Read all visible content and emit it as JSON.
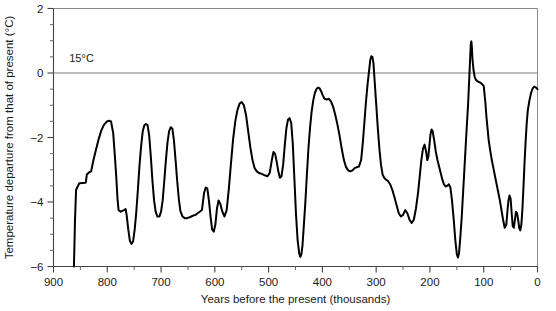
{
  "chart_data": {
    "type": "line",
    "title": "",
    "xlabel": "Years before the present (thousands)",
    "ylabel": "Temperature departure from that of present (°C)",
    "xlim": [
      900,
      0
    ],
    "ylim": [
      -6,
      2
    ],
    "x_ticks": [
      900,
      800,
      700,
      600,
      500,
      400,
      300,
      200,
      100,
      0
    ],
    "x_tick_labels": [
      "900",
      "800",
      "700",
      "600",
      "500",
      "400",
      "300",
      "200",
      "100",
      "0"
    ],
    "x_minor_step": 50,
    "y_ticks": [
      2,
      0,
      -2,
      -4,
      -6
    ],
    "y_tick_labels": [
      "2",
      "0",
      "−2",
      "−4",
      "−6"
    ],
    "y_minor_step": 0.5,
    "x_axis_reversed": true,
    "grid": false,
    "legend": null,
    "annotations": [
      {
        "text": "15°C",
        "x": 880,
        "y": 0.35,
        "note": "label for the present-day mean temperature reference line at 0"
      }
    ],
    "reference_lines": [
      {
        "axis": "y",
        "value": 0,
        "label": "15°C"
      }
    ],
    "series": [
      {
        "name": "Temperature departure",
        "color": "#000000",
        "points": [
          [
            862,
            -6.0
          ],
          [
            860,
            -4.55
          ],
          [
            858,
            -3.62
          ],
          [
            852,
            -3.42
          ],
          [
            840,
            -3.4
          ],
          [
            838,
            -3.15
          ],
          [
            833,
            -3.07
          ],
          [
            830,
            -3.05
          ],
          [
            826,
            -2.72
          ],
          [
            821,
            -2.38
          ],
          [
            816,
            -2.05
          ],
          [
            811,
            -1.78
          ],
          [
            806,
            -1.6
          ],
          [
            801,
            -1.51
          ],
          [
            797,
            -1.48
          ],
          [
            793,
            -1.5
          ],
          [
            789,
            -1.86
          ],
          [
            786,
            -2.55
          ],
          [
            783,
            -3.3
          ],
          [
            781,
            -3.9
          ],
          [
            779,
            -4.25
          ],
          [
            775,
            -4.3
          ],
          [
            769,
            -4.25
          ],
          [
            766,
            -4.22
          ],
          [
            764,
            -4.4
          ],
          [
            761,
            -4.85
          ],
          [
            758,
            -5.2
          ],
          [
            755,
            -5.3
          ],
          [
            752,
            -5.22
          ],
          [
            749,
            -4.85
          ],
          [
            746,
            -4.3
          ],
          [
            743,
            -3.6
          ],
          [
            740,
            -2.85
          ],
          [
            737,
            -2.25
          ],
          [
            734,
            -1.8
          ],
          [
            731,
            -1.62
          ],
          [
            728,
            -1.58
          ],
          [
            725,
            -1.62
          ],
          [
            722,
            -1.95
          ],
          [
            719,
            -2.6
          ],
          [
            716,
            -3.35
          ],
          [
            713,
            -3.95
          ],
          [
            710,
            -4.3
          ],
          [
            707,
            -4.45
          ],
          [
            703,
            -4.45
          ],
          [
            700,
            -4.3
          ],
          [
            697,
            -3.95
          ],
          [
            694,
            -3.35
          ],
          [
            691,
            -2.7
          ],
          [
            688,
            -2.15
          ],
          [
            685,
            -1.8
          ],
          [
            682,
            -1.68
          ],
          [
            679,
            -1.72
          ],
          [
            676,
            -2.1
          ],
          [
            673,
            -2.7
          ],
          [
            670,
            -3.35
          ],
          [
            667,
            -3.9
          ],
          [
            664,
            -4.28
          ],
          [
            660,
            -4.45
          ],
          [
            656,
            -4.5
          ],
          [
            652,
            -4.5
          ],
          [
            648,
            -4.48
          ],
          [
            644,
            -4.45
          ],
          [
            640,
            -4.42
          ],
          [
            636,
            -4.4
          ],
          [
            632,
            -4.35
          ],
          [
            628,
            -4.3
          ],
          [
            624,
            -4.25
          ],
          [
            620,
            -3.72
          ],
          [
            617,
            -3.55
          ],
          [
            614,
            -3.58
          ],
          [
            611,
            -3.95
          ],
          [
            608,
            -4.45
          ],
          [
            605,
            -4.85
          ],
          [
            602,
            -4.92
          ],
          [
            599,
            -4.7
          ],
          [
            596,
            -4.2
          ],
          [
            593,
            -3.95
          ],
          [
            590,
            -4.05
          ],
          [
            586,
            -4.3
          ],
          [
            582,
            -4.45
          ],
          [
            578,
            -4.25
          ],
          [
            574,
            -3.6
          ],
          [
            570,
            -2.8
          ],
          [
            566,
            -2.05
          ],
          [
            562,
            -1.5
          ],
          [
            558,
            -1.15
          ],
          [
            554,
            -0.95
          ],
          [
            550,
            -0.9
          ],
          [
            546,
            -1.0
          ],
          [
            542,
            -1.3
          ],
          [
            538,
            -1.8
          ],
          [
            534,
            -2.3
          ],
          [
            530,
            -2.7
          ],
          [
            526,
            -2.95
          ],
          [
            522,
            -3.05
          ],
          [
            518,
            -3.1
          ],
          [
            514,
            -3.12
          ],
          [
            510,
            -3.15
          ],
          [
            506,
            -3.18
          ],
          [
            502,
            -3.2
          ],
          [
            498,
            -3.1
          ],
          [
            494,
            -2.7
          ],
          [
            491,
            -2.45
          ],
          [
            488,
            -2.5
          ],
          [
            485,
            -2.75
          ],
          [
            482,
            -3.05
          ],
          [
            479,
            -3.25
          ],
          [
            476,
            -3.2
          ],
          [
            473,
            -2.85
          ],
          [
            470,
            -2.25
          ],
          [
            467,
            -1.72
          ],
          [
            464,
            -1.45
          ],
          [
            461,
            -1.4
          ],
          [
            458,
            -1.55
          ],
          [
            455,
            -2.2
          ],
          [
            452,
            -3.3
          ],
          [
            449,
            -4.4
          ],
          [
            446,
            -5.2
          ],
          [
            443,
            -5.6
          ],
          [
            441,
            -5.7
          ],
          [
            439,
            -5.62
          ],
          [
            437,
            -5.35
          ],
          [
            435,
            -4.85
          ],
          [
            432,
            -4.1
          ],
          [
            429,
            -3.2
          ],
          [
            426,
            -2.35
          ],
          [
            423,
            -1.7
          ],
          [
            420,
            -1.2
          ],
          [
            417,
            -0.85
          ],
          [
            414,
            -0.62
          ],
          [
            411,
            -0.5
          ],
          [
            408,
            -0.45
          ],
          [
            405,
            -0.48
          ],
          [
            402,
            -0.58
          ],
          [
            399,
            -0.7
          ],
          [
            396,
            -0.8
          ],
          [
            392,
            -0.82
          ],
          [
            388,
            -0.8
          ],
          [
            384,
            -0.88
          ],
          [
            380,
            -1.05
          ],
          [
            376,
            -1.3
          ],
          [
            372,
            -1.6
          ],
          [
            368,
            -1.95
          ],
          [
            364,
            -2.35
          ],
          [
            360,
            -2.7
          ],
          [
            356,
            -2.92
          ],
          [
            352,
            -3.02
          ],
          [
            348,
            -3.05
          ],
          [
            344,
            -3.02
          ],
          [
            340,
            -2.95
          ],
          [
            336,
            -2.92
          ],
          [
            332,
            -2.9
          ],
          [
            328,
            -2.7
          ],
          [
            325,
            -2.2
          ],
          [
            322,
            -1.55
          ],
          [
            319,
            -0.9
          ],
          [
            316,
            -0.35
          ],
          [
            313,
            0.1
          ],
          [
            311,
            0.4
          ],
          [
            309,
            0.52
          ],
          [
            307,
            0.5
          ],
          [
            305,
            0.3
          ],
          [
            303,
            -0.2
          ],
          [
            300,
            -0.95
          ],
          [
            297,
            -1.7
          ],
          [
            294,
            -2.35
          ],
          [
            291,
            -2.85
          ],
          [
            288,
            -3.15
          ],
          [
            285,
            -3.25
          ],
          [
            282,
            -3.3
          ],
          [
            278,
            -3.35
          ],
          [
            274,
            -3.45
          ],
          [
            270,
            -3.62
          ],
          [
            266,
            -3.85
          ],
          [
            262,
            -4.1
          ],
          [
            258,
            -4.35
          ],
          [
            254,
            -4.45
          ],
          [
            250,
            -4.4
          ],
          [
            246,
            -4.25
          ],
          [
            242,
            -4.35
          ],
          [
            238,
            -4.55
          ],
          [
            234,
            -4.65
          ],
          [
            230,
            -4.55
          ],
          [
            226,
            -4.2
          ],
          [
            222,
            -3.7
          ],
          [
            219,
            -3.2
          ],
          [
            216,
            -2.7
          ],
          [
            213,
            -2.35
          ],
          [
            210,
            -2.22
          ],
          [
            207,
            -2.45
          ],
          [
            205,
            -2.7
          ],
          [
            203,
            -2.6
          ],
          [
            201,
            -2.25
          ],
          [
            199,
            -1.9
          ],
          [
            197,
            -1.75
          ],
          [
            195,
            -1.8
          ],
          [
            192,
            -2.1
          ],
          [
            189,
            -2.45
          ],
          [
            186,
            -2.7
          ],
          [
            183,
            -2.9
          ],
          [
            180,
            -3.1
          ],
          [
            177,
            -3.3
          ],
          [
            174,
            -3.45
          ],
          [
            171,
            -3.52
          ],
          [
            168,
            -3.5
          ],
          [
            165,
            -3.45
          ],
          [
            162,
            -3.55
          ],
          [
            159,
            -3.95
          ],
          [
            156,
            -4.5
          ],
          [
            153,
            -5.15
          ],
          [
            150,
            -5.62
          ],
          [
            148,
            -5.72
          ],
          [
            146,
            -5.6
          ],
          [
            144,
            -5.2
          ],
          [
            141,
            -4.5
          ],
          [
            138,
            -3.6
          ],
          [
            135,
            -2.7
          ],
          [
            132,
            -1.8
          ],
          [
            129,
            -0.95
          ],
          [
            127,
            -0.2
          ],
          [
            125,
            0.55
          ],
          [
            124,
            0.92
          ],
          [
            123,
            0.98
          ],
          [
            122,
            0.8
          ],
          [
            121,
            0.45
          ],
          [
            119,
            0.1
          ],
          [
            117,
            -0.1
          ],
          [
            115,
            -0.2
          ],
          [
            112,
            -0.25
          ],
          [
            109,
            -0.28
          ],
          [
            106,
            -0.3
          ],
          [
            103,
            -0.35
          ],
          [
            100,
            -0.4
          ],
          [
            97,
            -0.9
          ],
          [
            95,
            -1.35
          ],
          [
            93,
            -1.7
          ],
          [
            91,
            -2.05
          ],
          [
            88,
            -2.4
          ],
          [
            85,
            -2.7
          ],
          [
            82,
            -2.95
          ],
          [
            79,
            -3.2
          ],
          [
            76,
            -3.45
          ],
          [
            73,
            -3.7
          ],
          [
            70,
            -3.95
          ],
          [
            67,
            -4.25
          ],
          [
            64,
            -4.55
          ],
          [
            61,
            -4.8
          ],
          [
            58,
            -4.7
          ],
          [
            56,
            -4.3
          ],
          [
            54,
            -3.95
          ],
          [
            52,
            -3.8
          ],
          [
            50,
            -3.9
          ],
          [
            48,
            -4.35
          ],
          [
            46,
            -4.75
          ],
          [
            44,
            -4.8
          ],
          [
            42,
            -4.55
          ],
          [
            40,
            -4.3
          ],
          [
            38,
            -4.35
          ],
          [
            36,
            -4.55
          ],
          [
            34,
            -4.8
          ],
          [
            32,
            -4.88
          ],
          [
            30,
            -4.7
          ],
          [
            28,
            -4.2
          ],
          [
            26,
            -3.5
          ],
          [
            24,
            -2.75
          ],
          [
            22,
            -2.1
          ],
          [
            20,
            -1.55
          ],
          [
            18,
            -1.15
          ],
          [
            15,
            -0.85
          ],
          [
            12,
            -0.62
          ],
          [
            9,
            -0.48
          ],
          [
            6,
            -0.42
          ],
          [
            3,
            -0.45
          ],
          [
            0,
            -0.5
          ]
        ]
      }
    ]
  }
}
